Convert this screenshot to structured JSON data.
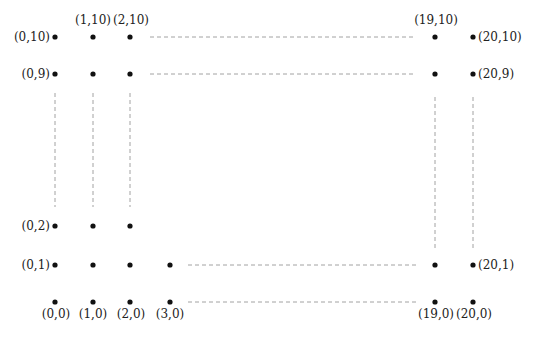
{
  "diagram": {
    "title": "",
    "type": "lattice-grid-points",
    "colors": {
      "dot": "#111111",
      "dash": "#8a8a8a",
      "label": "#222222",
      "background": "#ffffff"
    },
    "columns": [
      {
        "i": 0,
        "x": 55
      },
      {
        "i": 1,
        "x": 93
      },
      {
        "i": 2,
        "x": 130
      },
      {
        "i": 3,
        "x": 170
      },
      {
        "i": 19,
        "x": 435
      },
      {
        "i": 20,
        "x": 473
      }
    ],
    "rows": [
      {
        "j": 10,
        "y": 37
      },
      {
        "j": 9,
        "y": 74
      },
      {
        "j": 2,
        "y": 226
      },
      {
        "j": 1,
        "y": 265
      },
      {
        "j": 0,
        "y": 302
      }
    ],
    "points": [
      {
        "coord": "(0,10)",
        "x": 55,
        "y": 37
      },
      {
        "coord": "(1,10)",
        "x": 93,
        "y": 37
      },
      {
        "coord": "(2,10)",
        "x": 130,
        "y": 37
      },
      {
        "coord": "(19,10)",
        "x": 435,
        "y": 37
      },
      {
        "coord": "(20,10)",
        "x": 473,
        "y": 37
      },
      {
        "coord": "(0,9)",
        "x": 55,
        "y": 74
      },
      {
        "coord": "(1,9)",
        "x": 93,
        "y": 74
      },
      {
        "coord": "(2,9)",
        "x": 130,
        "y": 74
      },
      {
        "coord": "(19,9)",
        "x": 435,
        "y": 74
      },
      {
        "coord": "(20,9)",
        "x": 473,
        "y": 74
      },
      {
        "coord": "(0,2)",
        "x": 55,
        "y": 226
      },
      {
        "coord": "(1,2)",
        "x": 93,
        "y": 226
      },
      {
        "coord": "(2,2)",
        "x": 130,
        "y": 226
      },
      {
        "coord": "(0,1)",
        "x": 55,
        "y": 265
      },
      {
        "coord": "(1,1)",
        "x": 93,
        "y": 265
      },
      {
        "coord": "(2,1)",
        "x": 130,
        "y": 265
      },
      {
        "coord": "(3,1)",
        "x": 170,
        "y": 265
      },
      {
        "coord": "(19,1)",
        "x": 435,
        "y": 265
      },
      {
        "coord": "(20,1)",
        "x": 473,
        "y": 265
      },
      {
        "coord": "(0,0)",
        "x": 55,
        "y": 302
      },
      {
        "coord": "(1,0)",
        "x": 93,
        "y": 302
      },
      {
        "coord": "(2,0)",
        "x": 130,
        "y": 302
      },
      {
        "coord": "(3,0)",
        "x": 170,
        "y": 302
      },
      {
        "coord": "(19,0)",
        "x": 435,
        "y": 302
      },
      {
        "coord": "(20,0)",
        "x": 473,
        "y": 302
      }
    ],
    "labels": {
      "p0_10": "(0,10)",
      "p1_10": "(1,10)",
      "p2_10": "(2,10)",
      "p19_10": "(19,10)",
      "p20_10": "(20,10)",
      "p0_9": "(0,9)",
      "p20_9": "(20,9)",
      "p0_2": "(0,2)",
      "p0_1": "(0,1)",
      "p20_1": "(20,1)",
      "p0_0": "(0,0)",
      "p1_0": "(1,0)",
      "p2_0": "(2,0)",
      "p3_0": "(3,0)",
      "p19_0": "(19,0)",
      "p20_0": "(20,0)"
    },
    "dashed_lines": [
      {
        "name": "row-10-gap",
        "x1": 150,
        "y1": 37,
        "x2": 416,
        "y2": 37
      },
      {
        "name": "row-9-gap",
        "x1": 150,
        "y1": 74,
        "x2": 416,
        "y2": 74
      },
      {
        "name": "row-1-gap",
        "x1": 188,
        "y1": 265,
        "x2": 416,
        "y2": 265
      },
      {
        "name": "row-0-gap",
        "x1": 188,
        "y1": 302,
        "x2": 416,
        "y2": 302
      },
      {
        "name": "col-0-gap",
        "x1": 55,
        "y1": 93,
        "x2": 55,
        "y2": 207
      },
      {
        "name": "col-1-gap",
        "x1": 93,
        "y1": 93,
        "x2": 93,
        "y2": 207
      },
      {
        "name": "col-2-gap",
        "x1": 130,
        "y1": 93,
        "x2": 130,
        "y2": 207
      },
      {
        "name": "col-19-gap",
        "x1": 435,
        "y1": 97,
        "x2": 435,
        "y2": 248
      },
      {
        "name": "col-20-gap",
        "x1": 473,
        "y1": 97,
        "x2": 473,
        "y2": 248
      }
    ]
  }
}
